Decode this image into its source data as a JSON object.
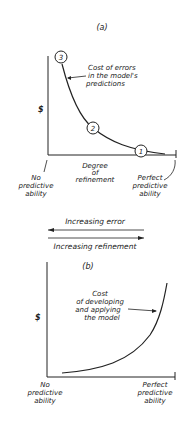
{
  "panel_a": {
    "label": "(a)",
    "y_label": "$",
    "curve_label": [
      "Cost of errors",
      "in the model's",
      "predictions"
    ],
    "points": [
      "3",
      "2",
      "1"
    ],
    "x_label": [
      "Degree",
      "of",
      "refinement"
    ],
    "left_label": [
      "No",
      "predictive",
      "ability"
    ],
    "right_label": [
      "Perfect",
      "predictive",
      "ability"
    ]
  },
  "arrows": {
    "error": "Increasing error",
    "refinement": "Increasing refinement"
  },
  "panel_b": {
    "label": "(b)",
    "y_label": "$",
    "curve_label": [
      "Cost",
      "of developing",
      "and applying",
      "the model"
    ],
    "left_label": [
      "No",
      "predictive",
      "ability"
    ],
    "right_label": [
      "Perfect",
      "predictive",
      "ability"
    ]
  }
}
